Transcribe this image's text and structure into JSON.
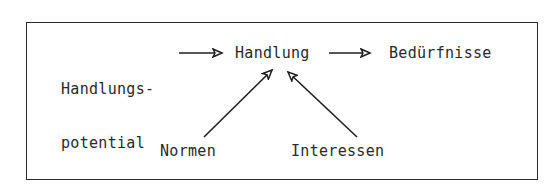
{
  "diagram": {
    "nodes": [
      {
        "id": "handlungspotential",
        "line1": "Handlungs-",
        "line2": "potential"
      },
      {
        "id": "handlung",
        "label": "Handlung"
      },
      {
        "id": "beduerfnisse",
        "label": "Bedürfnisse"
      },
      {
        "id": "normen",
        "label": "Normen"
      },
      {
        "id": "interessen",
        "label": "Interessen"
      }
    ],
    "edges": [
      {
        "from": "Handlungspotential",
        "to": "Handlung"
      },
      {
        "from": "Handlung",
        "to": "Bedürfnisse"
      },
      {
        "from": "Normen",
        "to": "Handlung"
      },
      {
        "from": "Interessen",
        "to": "Handlung"
      }
    ],
    "colors": {
      "stroke": "#1f1f1f",
      "text": "#2a2a2a",
      "background": "#ffffff"
    }
  }
}
